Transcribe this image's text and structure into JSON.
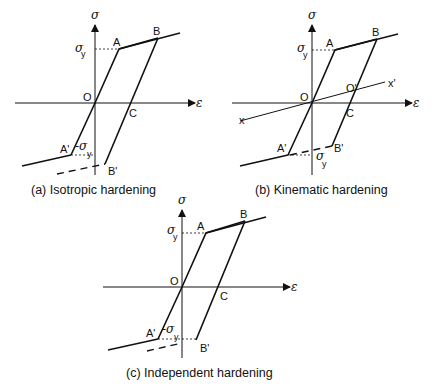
{
  "panels": [
    {
      "id": "a",
      "caption": "(a) Isotropic hardening",
      "labels": {
        "sigma": "σ",
        "epsilon": "ε",
        "sigma_y": "σ",
        "sigma_y_sub": "y",
        "neg_sigma_y": "-σ",
        "neg_sigma_y_sub": "y",
        "A": "A",
        "B": "B",
        "O": "O",
        "C": "C",
        "A_prime": "A'",
        "B_prime": "B'"
      }
    },
    {
      "id": "b",
      "caption": "(b) Kinematic hardening",
      "labels": {
        "sigma": "σ",
        "epsilon": "ε",
        "sigma_y": "σ",
        "sigma_y_sub": "y",
        "neg_sigma_y": "σ",
        "neg_sigma_y_sub": "y",
        "A": "A",
        "B": "B",
        "O": "O",
        "O_prime": "O'",
        "C": "C",
        "A_prime": "A'",
        "B_prime": "B'",
        "x": "x",
        "x_prime": "x'"
      }
    },
    {
      "id": "c",
      "caption": "(c) Independent hardening",
      "labels": {
        "sigma": "σ",
        "epsilon": "ε",
        "sigma_y": "σ",
        "sigma_y_sub": "y",
        "neg_sigma_y": "-σ",
        "neg_sigma_y_sub": "y",
        "A": "A",
        "B": "B",
        "O": "O",
        "C": "C",
        "A_prime": "A'",
        "B_prime": "B'"
      }
    }
  ]
}
